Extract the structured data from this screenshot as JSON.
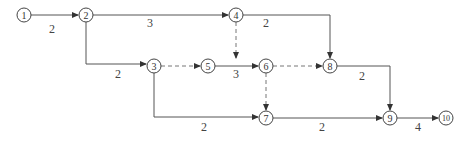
{
  "diagram": {
    "type": "activity-on-arrow network",
    "nodes": [
      {
        "id": "1",
        "label": "1",
        "x": 24,
        "y": 15
      },
      {
        "id": "2",
        "label": "2",
        "x": 86,
        "y": 15
      },
      {
        "id": "3",
        "label": "3",
        "x": 154,
        "y": 66
      },
      {
        "id": "4",
        "label": "4",
        "x": 236,
        "y": 15
      },
      {
        "id": "5",
        "label": "5",
        "x": 208,
        "y": 66
      },
      {
        "id": "6",
        "label": "6",
        "x": 266,
        "y": 66
      },
      {
        "id": "7",
        "label": "7",
        "x": 266,
        "y": 118
      },
      {
        "id": "8",
        "label": "8",
        "x": 330,
        "y": 66
      },
      {
        "id": "9",
        "label": "9",
        "x": 390,
        "y": 118
      },
      {
        "id": "10",
        "label": "10",
        "x": 446,
        "y": 118
      }
    ],
    "edges": [
      {
        "from": "1",
        "to": "2",
        "duration": "2",
        "dashed": false
      },
      {
        "from": "2",
        "to": "4",
        "duration": "3",
        "dashed": false
      },
      {
        "from": "2",
        "to": "3",
        "duration": "2",
        "dashed": false
      },
      {
        "from": "4",
        "to": "8",
        "duration": "2",
        "dashed": false
      },
      {
        "from": "4",
        "to": "5",
        "duration": "",
        "dashed": true
      },
      {
        "from": "3",
        "to": "5",
        "duration": "",
        "dashed": true
      },
      {
        "from": "3",
        "to": "7",
        "duration": "2",
        "dashed": false
      },
      {
        "from": "5",
        "to": "6",
        "duration": "3",
        "dashed": false
      },
      {
        "from": "6",
        "to": "8",
        "duration": "",
        "dashed": true
      },
      {
        "from": "6",
        "to": "7",
        "duration": "",
        "dashed": true
      },
      {
        "from": "8",
        "to": "9",
        "duration": "2",
        "dashed": false
      },
      {
        "from": "7",
        "to": "9",
        "duration": "2",
        "dashed": false
      },
      {
        "from": "9",
        "to": "10",
        "duration": "4",
        "dashed": false
      }
    ]
  }
}
